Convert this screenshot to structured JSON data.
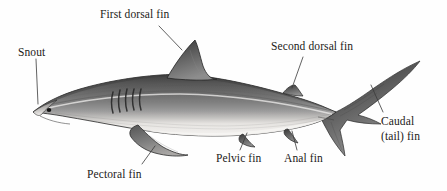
{
  "figure": {
    "background_color": "#fefefe",
    "text_color": "#1c1a18",
    "leader_line_color": "#3a3a3a",
    "illustration_style": "grayscale-halftone-engraving"
  },
  "labels": {
    "snout": "Snout",
    "first_dorsal_fin": "First dorsal fin",
    "second_dorsal_fin": "Second dorsal fin",
    "caudal_fin_line1": "Caudal",
    "caudal_fin_line2": "(tail) fin",
    "pectoral_fin": "Pectoral fin",
    "pelvic_fin": "Pelvic fin",
    "anal_fin": "Anal fin"
  },
  "palette": {
    "dorsal_dark": "#4a4a4a",
    "dorsal_mid": "#6e6e6e",
    "flank_light": "#a8a8a8",
    "belly_white": "#f2f0ee",
    "outline": "#2b2b2b",
    "fin_dark": "#3e3e3e",
    "gill_slit": "#2a2a2a",
    "eye": "#141414"
  }
}
